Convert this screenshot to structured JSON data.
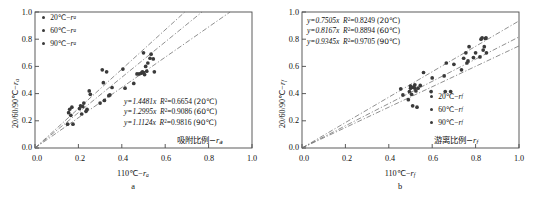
{
  "figure": {
    "panels": [
      {
        "letter": "a",
        "xlabel_prefix": "110",
        "xlabel_degc": "℃",
        "xlabel_sub": "a",
        "ylabel_prefix": "20/60/90",
        "ylabel_degc": "℃",
        "ylabel_sub": "a",
        "series_note_cn": "吸附比例",
        "series_note_sub": "a",
        "legend": [
          {
            "temp": "20",
            "unit": "℃",
            "var": "r",
            "sub": "a"
          },
          {
            "temp": "60",
            "unit": "℃",
            "var": "r",
            "sub": "a"
          },
          {
            "temp": "90",
            "unit": "℃",
            "var": "r",
            "sub": "a"
          }
        ],
        "equations": [
          {
            "slope": "1.4481",
            "r2": "0.6654",
            "temp": "20℃"
          },
          {
            "slope": "1.2995",
            "r2": "0.9086",
            "temp": "60℃"
          },
          {
            "slope": "1.1124",
            "r2": "0.9816",
            "temp": "90℃"
          }
        ]
      },
      {
        "letter": "b",
        "xlabel_prefix": "110",
        "xlabel_degc": "℃",
        "xlabel_sub": "f",
        "ylabel_prefix": "20/60/90",
        "ylabel_degc": "℃",
        "ylabel_sub": "f",
        "series_note_cn": "游离比例",
        "series_note_sub": "f",
        "legend": [
          {
            "temp": "20",
            "unit": "℃",
            "var": "r",
            "sub": "f"
          },
          {
            "temp": "60",
            "unit": "℃",
            "var": "r",
            "sub": "f"
          },
          {
            "temp": "90",
            "unit": "℃",
            "var": "r",
            "sub": "f"
          }
        ],
        "equations": [
          {
            "slope": "0.7505",
            "r2": "0.8249",
            "temp": "20℃"
          },
          {
            "slope": "0.8167",
            "r2": "0.8894",
            "temp": "60℃"
          },
          {
            "slope": "0.9345",
            "r2": "0.9705",
            "temp": "90℃"
          }
        ]
      }
    ],
    "ticks": [
      "0.0",
      "0.2",
      "0.4",
      "0.6",
      "0.8",
      "1.0"
    ],
    "colors": {
      "marker": "#3a3a3a",
      "line": "#6b6b6b",
      "axis": "#4a4a4a",
      "text": "#111111"
    }
  },
  "chart_data": [
    {
      "type": "scatter",
      "title": "a",
      "xlabel": "110℃−r_a",
      "ylabel": "20/60/90℃−r_a",
      "xlim": [
        0,
        1
      ],
      "ylim": [
        0,
        1
      ],
      "xticks": [
        0.0,
        0.2,
        0.4,
        0.6,
        0.8,
        1.0
      ],
      "yticks": [
        0.0,
        0.2,
        0.4,
        0.6,
        0.8,
        1.0
      ],
      "grid": false,
      "legend_position": "top-left",
      "annotation_cn": "吸附比例−r_a",
      "fits": [
        {
          "name": "20℃",
          "equation": "y=1.4481x",
          "slope": 1.4481,
          "intercept": 0,
          "r2": 0.6654
        },
        {
          "name": "60℃",
          "equation": "y=1.2995x",
          "slope": 1.2995,
          "intercept": 0,
          "r2": 0.9086
        },
        {
          "name": "90℃",
          "equation": "y=1.1124x",
          "slope": 1.1124,
          "intercept": 0,
          "r2": 0.9816
        }
      ],
      "series": [
        {
          "name": "20℃−r_a",
          "points": [
            [
              0.15,
              0.175
            ],
            [
              0.155,
              0.26
            ],
            [
              0.16,
              0.285
            ],
            [
              0.165,
              0.24
            ],
            [
              0.17,
              0.3
            ],
            [
              0.175,
              0.175
            ],
            [
              0.205,
              0.29
            ],
            [
              0.21,
              0.31
            ],
            [
              0.215,
              0.25
            ],
            [
              0.22,
              0.305
            ],
            [
              0.225,
              0.33
            ],
            [
              0.235,
              0.27
            ],
            [
              0.24,
              0.285
            ],
            [
              0.25,
              0.42
            ],
            [
              0.255,
              0.395
            ],
            [
              0.3,
              0.33
            ],
            [
              0.31,
              0.575
            ],
            [
              0.315,
              0.48
            ],
            [
              0.32,
              0.35
            ],
            [
              0.33,
              0.56
            ],
            [
              0.34,
              0.385
            ],
            [
              0.345,
              0.39
            ],
            [
              0.355,
              0.445
            ],
            [
              0.405,
              0.58
            ],
            [
              0.415,
              0.44
            ],
            [
              0.455,
              0.475
            ],
            [
              0.47,
              0.545
            ],
            [
              0.48,
              0.545
            ],
            [
              0.49,
              0.55
            ],
            [
              0.495,
              0.56
            ],
            [
              0.5,
              0.7
            ],
            [
              0.5,
              0.555
            ],
            [
              0.505,
              0.54
            ],
            [
              0.51,
              0.6
            ],
            [
              0.515,
              0.565
            ],
            [
              0.52,
              0.625
            ],
            [
              0.53,
              0.66
            ],
            [
              0.535,
              0.69
            ],
            [
              0.545,
              0.655
            ],
            [
              0.55,
              0.56
            ]
          ]
        }
      ]
    },
    {
      "type": "scatter",
      "title": "b",
      "xlabel": "110℃−r_f",
      "ylabel": "20/60/90℃−r_f",
      "xlim": [
        0,
        1
      ],
      "ylim": [
        0,
        1
      ],
      "xticks": [
        0.0,
        0.2,
        0.4,
        0.6,
        0.8,
        1.0
      ],
      "yticks": [
        0.0,
        0.2,
        0.4,
        0.6,
        0.8,
        1.0
      ],
      "grid": false,
      "legend_position": "bottom-right",
      "annotation_cn": "游离比例−r_f",
      "fits": [
        {
          "name": "20℃",
          "equation": "y=0.7505x",
          "slope": 0.7505,
          "intercept": 0,
          "r2": 0.8249
        },
        {
          "name": "60℃",
          "equation": "y=0.8167x",
          "slope": 0.8167,
          "intercept": 0,
          "r2": 0.8894
        },
        {
          "name": "90℃",
          "equation": "y=0.9345x",
          "slope": 0.9345,
          "intercept": 0,
          "r2": 0.9705
        }
      ],
      "series": [
        {
          "name": "20℃−r_f",
          "points": [
            [
              0.455,
              0.435
            ],
            [
              0.465,
              0.39
            ],
            [
              0.49,
              0.355
            ],
            [
              0.495,
              0.415
            ],
            [
              0.5,
              0.44
            ],
            [
              0.5,
              0.455
            ],
            [
              0.505,
              0.445
            ],
            [
              0.505,
              0.395
            ],
            [
              0.51,
              0.31
            ],
            [
              0.515,
              0.45
            ],
            [
              0.52,
              0.44
            ],
            [
              0.52,
              0.465
            ],
            [
              0.525,
              0.42
            ],
            [
              0.53,
              0.3
            ],
            [
              0.535,
              0.44
            ],
            [
              0.545,
              0.46
            ],
            [
              0.56,
              0.555
            ],
            [
              0.595,
              0.415
            ],
            [
              0.6,
              0.515
            ],
            [
              0.655,
              0.53
            ],
            [
              0.66,
              0.415
            ],
            [
              0.665,
              0.625
            ],
            [
              0.685,
              0.415
            ],
            [
              0.7,
              0.615
            ],
            [
              0.735,
              0.575
            ],
            [
              0.745,
              0.66
            ],
            [
              0.755,
              0.7
            ],
            [
              0.76,
              0.625
            ],
            [
              0.765,
              0.64
            ],
            [
              0.77,
              0.745
            ],
            [
              0.79,
              0.665
            ],
            [
              0.8,
              0.7
            ],
            [
              0.82,
              0.67
            ],
            [
              0.825,
              0.8
            ],
            [
              0.83,
              0.81
            ],
            [
              0.835,
              0.72
            ],
            [
              0.84,
              0.745
            ],
            [
              0.845,
              0.805
            ],
            [
              0.848,
              0.81
            ],
            [
              0.85,
              0.7
            ]
          ]
        }
      ]
    }
  ]
}
